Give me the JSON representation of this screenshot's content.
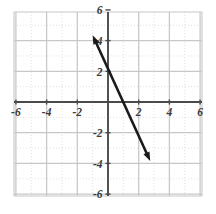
{
  "figure": {
    "kind": "cartesian-coordinate-plane-with-line",
    "background_color": "#ffffff",
    "axis_color": "#4a4a4a",
    "major_grid_color": "#c8c8c8",
    "minor_grid_color": "#d9d9d9",
    "line_color": "#1a1a1a",
    "label_color": "#3a3a3a"
  },
  "chart_data": {
    "type": "line",
    "title": "",
    "xlabel": "",
    "ylabel": "",
    "xlim": [
      -7,
      7
    ],
    "ylim": [
      -7,
      7
    ],
    "grid": true,
    "major_grid_step": 2,
    "minor_grid_step": 1,
    "legend": "none",
    "x_tick_labels": [
      "-6",
      "-4",
      "-2",
      "2",
      "4",
      "6"
    ],
    "x_tick_values": [
      -6,
      -4,
      -2,
      2,
      4,
      6
    ],
    "y_tick_labels": [
      "6",
      "4",
      "2",
      "-2",
      "-4",
      "-6"
    ],
    "y_tick_values": [
      6,
      4,
      2,
      -2,
      -4,
      -6
    ],
    "series": [
      {
        "name": "line",
        "style": "double-headed-arrow",
        "slope": -2.15,
        "y_intercept": 2.2,
        "x_intercept": 1.02,
        "endpoints": [
          {
            "x": -1.0,
            "y": 4.35
          },
          {
            "x": 2.75,
            "y": -3.85
          }
        ],
        "arrow_start": true,
        "arrow_end": true
      }
    ]
  }
}
